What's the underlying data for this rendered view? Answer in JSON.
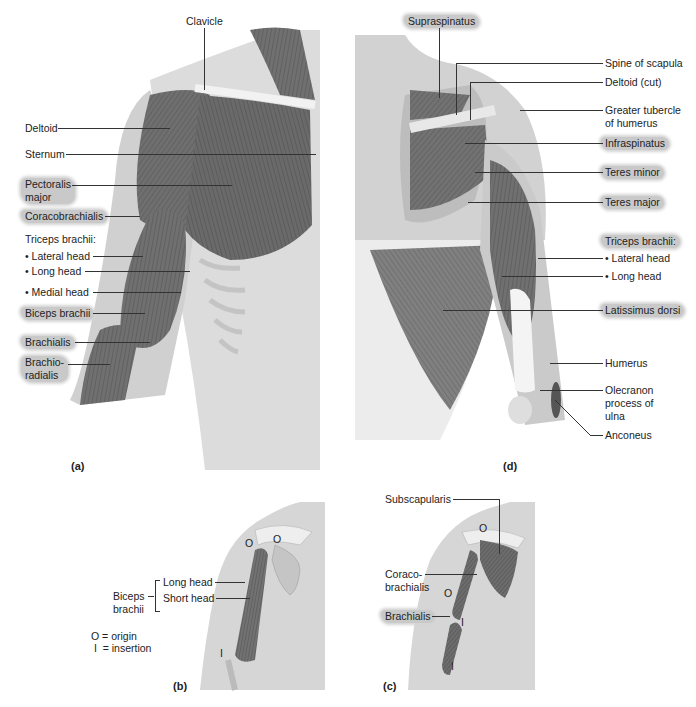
{
  "figure": {
    "panels": {
      "a": {
        "label": "(a)",
        "title": "Anterior view of shoulder and arm muscles",
        "labels": {
          "clavicle": "Clavicle",
          "deltoid": "Deltoid",
          "sternum": "Sternum",
          "pectoralis_major_1": "Pectoralis",
          "pectoralis_major_2": "major",
          "coracobrachialis": "Coracobrachialis",
          "triceps_brachii": "Triceps brachii:",
          "lateral_head": "• Lateral head",
          "long_head": "• Long head",
          "medial_head": "• Medial head",
          "biceps_brachii": "Biceps brachii",
          "brachialis": "Brachialis",
          "brachioradialis_1": "Brachio-",
          "brachioradialis_2": "radialis"
        }
      },
      "d": {
        "label": "(d)",
        "labels": {
          "supraspinatus": "Supraspinatus",
          "spine_of_scapula": "Spine of scapula",
          "deltoid_cut": "Deltoid (cut)",
          "greater_tubercle_1": "Greater tubercle",
          "greater_tubercle_2": "of humerus",
          "infraspinatus": "Infraspinatus",
          "teres_minor": "Teres minor",
          "teres_major": "Teres major",
          "triceps_brachii": "Triceps brachii:",
          "lateral_head": "• Lateral head",
          "long_head": "• Long head",
          "latissimus_dorsi": "Latissimus dorsi",
          "humerus": "Humerus",
          "olecranon_1": "Olecranon",
          "olecranon_2": "process of",
          "olecranon_3": "ulna",
          "anconeus": "Anconeus"
        }
      },
      "b": {
        "label": "(b)",
        "labels": {
          "biceps_1": "Biceps",
          "biceps_2": "brachii",
          "long_head": "Long head",
          "short_head": "Short head",
          "origin_marker": "O",
          "insertion_marker": "I"
        },
        "legend": {
          "origin": "O = origin",
          "insertion": " I  = insertion"
        }
      },
      "c": {
        "label": "(c)",
        "labels": {
          "subscapularis": "Subscapularis",
          "coracobrachialis_1": "Coraco-",
          "coracobrachialis_2": "brachialis",
          "brachialis": "Brachialis",
          "origin_marker": "O",
          "insertion_marker": "I"
        }
      }
    },
    "colors": {
      "muscle": "#6e6e6e",
      "muscle_dark": "#4a4a4a",
      "skin": "#d8d8d8",
      "bone": "#eeeeee",
      "highlight": "#c9c9c9",
      "text": "#222222"
    }
  }
}
